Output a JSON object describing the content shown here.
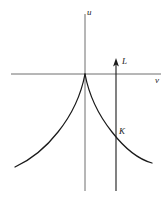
{
  "figure": {
    "type": "math-diagram",
    "background_color": "#ffffff",
    "stroke_color": "#1a1a1a",
    "axis_color": "#6e6e6e"
  },
  "axes": {
    "vertical": {
      "label": "u",
      "name": "u-axis",
      "x": 85,
      "y_top": 14,
      "y_bottom": 191
    },
    "horizontal": {
      "label": "v",
      "name": "v-axis",
      "y": 74,
      "x_left": 11,
      "x_right": 161
    },
    "origin": {
      "x": 85,
      "y": 74
    }
  },
  "vector": {
    "label": "L",
    "name": "vertical-line-with-arrow",
    "x": 116,
    "y_bottom": 191,
    "y_tip": 59,
    "arrow_direction": "up"
  },
  "points": [
    {
      "label": "K",
      "name": "intersection-point-k",
      "x": 116,
      "y": 136
    }
  ],
  "curve": {
    "name": "cusp-curve",
    "cusp_at": {
      "x": 85,
      "y": 74
    },
    "left_endpoint": {
      "x": 15,
      "y": 167
    },
    "right_endpoint": {
      "x": 152,
      "y": 163
    },
    "left_path": "M 85 74 C 82 90 74 112 58 132 C 44 150 28 161 15 167",
    "right_path": "M 85 74 C 88 90 96 112 112 132 C 126 150 141 160 152 163"
  },
  "chart_data": {
    "type": "line",
    "title": "",
    "xlabel": "v",
    "ylabel": "u",
    "grid": false,
    "legend": null,
    "annotations": [
      {
        "text": "u",
        "role": "vertical-axis-label"
      },
      {
        "text": "v",
        "role": "horizontal-axis-label"
      },
      {
        "text": "L",
        "role": "arrow-label"
      },
      {
        "text": "K",
        "role": "point-label"
      }
    ],
    "series": [
      {
        "name": "cusp-curve-left-branch",
        "x": [
          -70,
          -58,
          -44,
          -27,
          -12,
          -5,
          0
        ],
        "y": [
          -93,
          -87,
          -76,
          -58,
          -32,
          -14,
          0
        ]
      },
      {
        "name": "cusp-curve-right-branch",
        "x": [
          0,
          5,
          12,
          27,
          44,
          58,
          67
        ],
        "y": [
          0,
          -14,
          -32,
          -58,
          -76,
          -86,
          -89
        ]
      },
      {
        "name": "vertical-arrow-L",
        "x": [
          31,
          31
        ],
        "y": [
          -117,
          15
        ]
      }
    ]
  }
}
